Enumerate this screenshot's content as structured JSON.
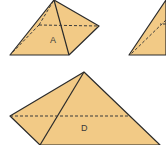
{
  "figure": {
    "colors": {
      "fill": "#F2CA86",
      "stroke": "#2b2b2b"
    },
    "shapes": [
      {
        "id": "A",
        "label": "A"
      },
      {
        "id": "B-partial",
        "label": ""
      },
      {
        "id": "D",
        "label": "D"
      }
    ]
  }
}
